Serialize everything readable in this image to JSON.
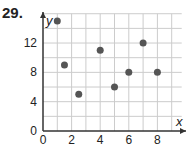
{
  "problem_number": "29.",
  "chart_data": {
    "type": "scatter",
    "title": "",
    "xlabel": "x",
    "ylabel": "y",
    "xlim": [
      0,
      9.7
    ],
    "ylim": [
      0,
      16
    ],
    "x_ticks": [
      0,
      2,
      4,
      6,
      8
    ],
    "y_ticks": [
      0,
      4,
      8,
      12
    ],
    "grid": true,
    "grid_x_step": 1,
    "grid_y_step": 2,
    "points": [
      {
        "x": 1,
        "y": 15
      },
      {
        "x": 1.5,
        "y": 9
      },
      {
        "x": 2.5,
        "y": 5
      },
      {
        "x": 4,
        "y": 11
      },
      {
        "x": 5,
        "y": 6
      },
      {
        "x": 6,
        "y": 8
      },
      {
        "x": 7,
        "y": 12
      },
      {
        "x": 8,
        "y": 8
      }
    ],
    "point_color": "#555555",
    "grid_color": "#cccccc",
    "axis_color": "#333333"
  }
}
